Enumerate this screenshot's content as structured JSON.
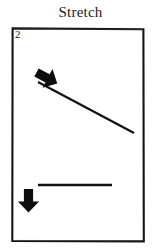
{
  "figure": {
    "title": "Stretch",
    "panel_label": "2",
    "ink_color": "#121212",
    "background_color": "#ffffff",
    "border_color": "#141414"
  },
  "panel": {
    "x": 11,
    "y": 27,
    "width": 134,
    "height": 216,
    "border_width": 2
  },
  "elements": {
    "upper": {
      "name": "upper-motion-arrow",
      "arrow_direction": "up-right",
      "arrow_angle_deg": 62,
      "arrow_tip": [
        30,
        31
      ],
      "arrow_tail": [
        20,
        56
      ],
      "line_name": "upper-diagonal-line",
      "line_start": [
        27,
        55
      ],
      "line_end": [
        123,
        106
      ],
      "line_width": 2.2,
      "line_orientation": "descending-right"
    },
    "lower": {
      "name": "lower-motion-arrow",
      "arrow_direction": "down",
      "arrow_angle_deg": 270,
      "arrow_tip": [
        31,
        175
      ],
      "arrow_tail": [
        31,
        149
      ],
      "line_name": "lower-horizontal-line",
      "line_start": [
        27,
        158
      ],
      "line_end": [
        101,
        158
      ],
      "line_width": 2.2,
      "line_orientation": "horizontal"
    }
  },
  "icons": {
    "upper_arrow_icon": "arrow-up-right-icon",
    "lower_arrow_icon": "arrow-down-icon"
  }
}
